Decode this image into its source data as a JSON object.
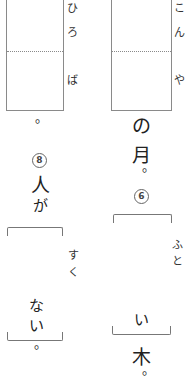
{
  "left_column": {
    "box_furigana": [
      "ひ",
      "ろ",
      "ば"
    ],
    "after_box_punct": "。",
    "question_number": "8",
    "text_before": [
      "人",
      "が"
    ],
    "bracket_furigana": [
      "す",
      "く"
    ],
    "text_in_bracket": [
      "な",
      "い"
    ],
    "end_punct": "。"
  },
  "right_column": {
    "box_furigana": [
      "こ",
      "ん",
      "や"
    ],
    "text_after_box": [
      "の",
      "月"
    ],
    "after_text_punct": "。",
    "question_number": "6",
    "bracket_furigana": [
      "ふ",
      "と"
    ],
    "text_in_bracket": [
      "い"
    ],
    "text_after_bracket": "木",
    "end_punct": "。"
  }
}
